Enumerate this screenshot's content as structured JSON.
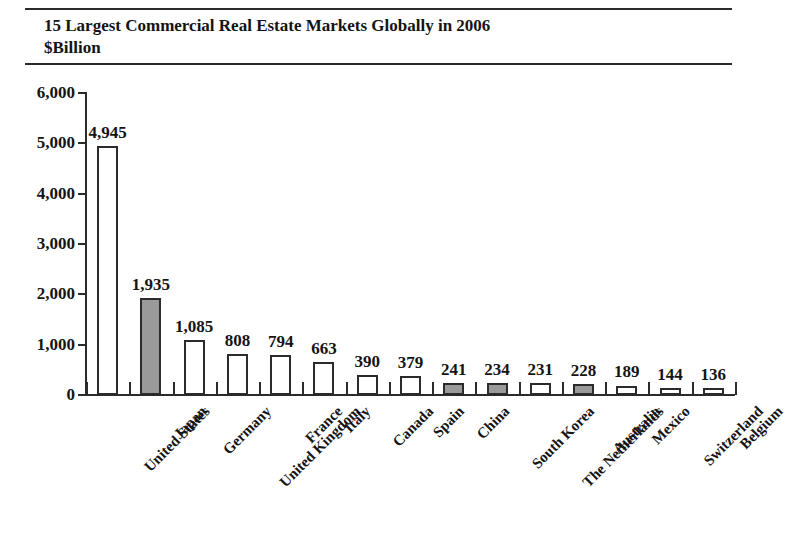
{
  "header": {
    "title_line1": "15 Largest Commercial Real Estate Markets Globally in 2006",
    "title_line2": "$Billion"
  },
  "chart_data": {
    "type": "bar",
    "title": "15 Largest Commercial Real Estate Markets Globally in 2006",
    "subtitle": "$Billion",
    "xlabel": "",
    "ylabel": "",
    "ylim": [
      0,
      6000
    ],
    "yticks": [
      0,
      1000,
      2000,
      3000,
      4000,
      5000,
      6000
    ],
    "ytick_labels": [
      "0",
      "1,000",
      "2,000",
      "3,000",
      "4,000",
      "5,000",
      "6,000"
    ],
    "grid": false,
    "legend": false,
    "categories": [
      "United States",
      "Japan",
      "Germany",
      "United Kingdom",
      "France",
      "Italy",
      "Canada",
      "Spain",
      "China",
      "South Korea",
      "The Netherlands",
      "Australia",
      "Mexico",
      "Switzerland",
      "Belgium"
    ],
    "values": [
      4945,
      1935,
      1085,
      808,
      794,
      663,
      390,
      379,
      241,
      234,
      231,
      228,
      189,
      144,
      136
    ],
    "value_labels": [
      "4,945",
      "1,935",
      "1,085",
      "808",
      "794",
      "663",
      "390",
      "379",
      "241",
      "234",
      "231",
      "228",
      "189",
      "144",
      "136"
    ],
    "shaded": [
      false,
      true,
      false,
      false,
      false,
      false,
      false,
      false,
      true,
      true,
      false,
      true,
      false,
      false,
      false
    ],
    "bar_fill_default": "#ffffff",
    "bar_fill_shaded": "#9a9a9a",
    "bar_edge_color": "#2b2b2b",
    "axis_color": "#2b2b2b",
    "text_color": "#141414"
  }
}
